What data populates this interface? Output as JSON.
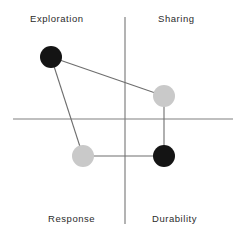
{
  "chart_data": {
    "type": "scatter",
    "title": "",
    "subtitle": "",
    "xlabel": "",
    "ylabel": "",
    "grid": false,
    "legend": null,
    "axis_style": "quadrant-cross",
    "xlim": [
      -1,
      1
    ],
    "ylim": [
      -1,
      1
    ],
    "quadrants": [
      {
        "name": "exploration",
        "label": "Exploration",
        "position": "top-left"
      },
      {
        "name": "sharing",
        "label": "Sharing",
        "position": "top-right"
      },
      {
        "name": "response",
        "label": "Response",
        "position": "bottom-left"
      },
      {
        "name": "durability",
        "label": "Durability",
        "position": "bottom-right"
      }
    ],
    "points": [
      {
        "id": "p1",
        "quadrant": "Exploration",
        "color": "#141414",
        "fill": "black",
        "cx": 51,
        "cy": 57,
        "r": 11,
        "x": -0.67,
        "y": 0.6
      },
      {
        "id": "p2",
        "quadrant": "Sharing",
        "color": "#c9c9c9",
        "fill": "gray",
        "cx": 164,
        "cy": 96,
        "r": 11,
        "x": 0.36,
        "y": 0.22
      },
      {
        "id": "p3",
        "quadrant": "Response",
        "color": "#c9c9c9",
        "fill": "gray",
        "cx": 83,
        "cy": 156,
        "r": 11,
        "x": -0.38,
        "y": -0.35
      },
      {
        "id": "p4",
        "quadrant": "Durability",
        "color": "#141414",
        "fill": "black",
        "cx": 164,
        "cy": 156,
        "r": 11,
        "x": 0.36,
        "y": -0.35
      }
    ],
    "connections": [
      {
        "from": "p1",
        "to": "p2"
      },
      {
        "from": "p2",
        "to": "p4"
      },
      {
        "from": "p4",
        "to": "p3"
      },
      {
        "from": "p3",
        "to": "p1"
      }
    ],
    "axes": {
      "vertical": {
        "x": 125,
        "y1": 17,
        "y2": 224,
        "color": "#808080",
        "width": 1.2
      },
      "horizontal": {
        "y": 119,
        "x1": 13,
        "x2": 233,
        "color": "#808080",
        "width": 1.2
      }
    },
    "colors": {
      "background": "#ffffff",
      "axis": "#808080",
      "connector": "#6e6e6e",
      "point_black": "#141414",
      "point_gray": "#c9c9c9",
      "label_text": "#2b2b2b"
    }
  }
}
